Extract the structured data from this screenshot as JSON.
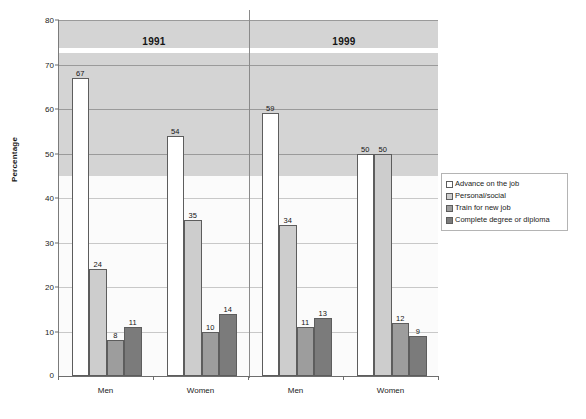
{
  "chart_data": {
    "type": "bar",
    "title": "",
    "xlabel": "",
    "ylabel": "Percentage",
    "ylim": [
      0,
      80
    ],
    "ytick_step": 10,
    "yticks": [
      0,
      10,
      20,
      30,
      40,
      50,
      60,
      70,
      80
    ],
    "grid": true,
    "legend_position": "right",
    "panels": [
      {
        "label": "1991",
        "groups": [
          "Men",
          "Women"
        ]
      },
      {
        "label": "1999",
        "groups": [
          "Men",
          "Women"
        ]
      }
    ],
    "categories": [
      "Men",
      "Women",
      "Men",
      "Women"
    ],
    "series": [
      {
        "name": "Advance on the job",
        "color": "#ffffff",
        "values": [
          67,
          54,
          59,
          50
        ]
      },
      {
        "name": "Personal/social",
        "color": "#cdcdcd",
        "values": [
          24,
          35,
          34,
          50
        ]
      },
      {
        "name": "Train for new job",
        "color": "#9d9d9d",
        "values": [
          8,
          10,
          11,
          12
        ]
      },
      {
        "name": "Complete degree or diploma",
        "color": "#7b7b7b",
        "values": [
          11,
          14,
          13,
          9
        ]
      }
    ]
  },
  "axes": {
    "y_title": "Percentage",
    "y_tick_labels": [
      "80",
      "70",
      "60",
      "50",
      "40",
      "30",
      "20",
      "10",
      "0"
    ],
    "x_group_labels": [
      "Men",
      "Women",
      "Men",
      "Women"
    ]
  },
  "era_headers": [
    {
      "label": "1991"
    },
    {
      "label": "1999"
    }
  ],
  "legend": {
    "items": [
      {
        "label": "Advance on the job",
        "color": "#ffffff"
      },
      {
        "label": "Personal/social",
        "color": "#cdcdcd"
      },
      {
        "label": "Train for new job",
        "color": "#9d9d9d"
      },
      {
        "label": "Complete degree or diploma",
        "color": "#7b7b7b"
      }
    ]
  },
  "bar_labels": {
    "g0": [
      "67",
      "24",
      "8",
      "11"
    ],
    "g1": [
      "54",
      "35",
      "10",
      "14"
    ],
    "g2": [
      "59",
      "34",
      "11",
      "13"
    ],
    "g3": [
      "50",
      "50",
      "12",
      "9"
    ]
  },
  "colors": {
    "plot_background_upper": "#d4d4d4",
    "plot_background_lower": "#fbfbfb",
    "grid": "#9a9a9a",
    "axis": "#6d6d6d",
    "bar_outline": "#5d5d5d",
    "text": "#1b1b1b"
  }
}
